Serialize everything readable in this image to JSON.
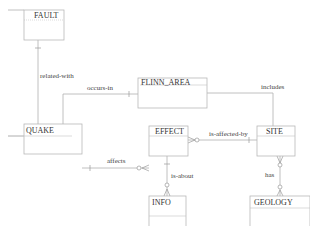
{
  "diagram": {
    "type": "entity-relationship",
    "notation": "crow's foot",
    "entities": [
      {
        "id": "fault",
        "label": "FAULT"
      },
      {
        "id": "flinn_area",
        "label": "FLINN_AREA"
      },
      {
        "id": "quake",
        "label": "QUAKE"
      },
      {
        "id": "effect",
        "label": "EFFECT"
      },
      {
        "id": "site",
        "label": "SITE"
      },
      {
        "id": "info",
        "label": "INFO"
      },
      {
        "id": "geology",
        "label": "GEOLOGY"
      }
    ],
    "relationships": [
      {
        "id": "related_with",
        "label": "related-with",
        "from": "FAULT",
        "to": "QUAKE"
      },
      {
        "id": "occurs_in",
        "label": "occurs-in",
        "from": "FLINN_AREA",
        "to": "QUAKE"
      },
      {
        "id": "includes",
        "label": "includes",
        "from": "FLINN_AREA",
        "to": "SITE"
      },
      {
        "id": "affects",
        "label": "affects",
        "from": "QUAKE",
        "to": "EFFECT"
      },
      {
        "id": "is_affected_by",
        "label": "is-affected-by",
        "from": "SITE",
        "to": "EFFECT"
      },
      {
        "id": "is_about",
        "label": "is-about",
        "from": "EFFECT",
        "to": "INFO"
      },
      {
        "id": "has",
        "label": "has",
        "from": "SITE",
        "to": "GEOLOGY"
      }
    ]
  },
  "colors": {
    "background": "#ffffff",
    "box_stroke": "#b8b8b8",
    "line": "#b0b0b0",
    "text": "#333333"
  }
}
